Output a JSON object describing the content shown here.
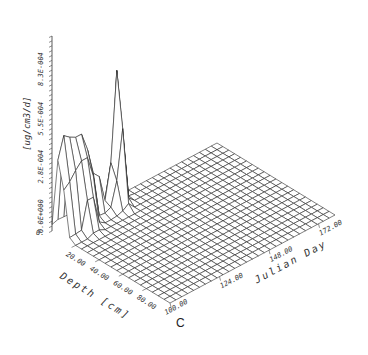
{
  "chart_data": {
    "type": "surface3d",
    "title": "",
    "caption": "C",
    "x_axis": {
      "label": "Depth [cm]",
      "range": [
        0,
        100
      ],
      "tick_labels": [
        "0.",
        "20.00",
        "40.00",
        "60.00",
        "80.00"
      ],
      "tick_values": [
        0,
        20,
        40,
        60,
        80
      ]
    },
    "y_axis": {
      "label": "Julian Day",
      "range": [
        100,
        180
      ],
      "tick_labels": [
        "100.00",
        "124.00",
        "148.00",
        "172.00"
      ],
      "tick_values": [
        100,
        124,
        148,
        172
      ]
    },
    "z_axis": {
      "label": "[ug/cm3/d]",
      "range": [
        0,
        0.0011
      ],
      "tick_labels": [
        "0.0E+000",
        "2.8E-004",
        "5.5E-004",
        "8.3E-004"
      ],
      "tick_values": [
        0,
        0.00028,
        0.00055,
        0.00083
      ]
    },
    "grid_size": {
      "depth_steps": 20,
      "day_steps": 28
    },
    "peaks": [
      {
        "depth": 5,
        "day": 101,
        "value": 0.00062
      },
      {
        "depth": 10,
        "day": 101,
        "value": 0.0004
      },
      {
        "depth": 5,
        "day": 104,
        "value": 0.0009
      },
      {
        "depth": 10,
        "day": 104,
        "value": 0.0005
      },
      {
        "depth": 5,
        "day": 107,
        "value": 0.00098
      },
      {
        "depth": 10,
        "day": 107,
        "value": 0.00066
      },
      {
        "depth": 5,
        "day": 110,
        "value": 0.0011
      },
      {
        "depth": 10,
        "day": 110,
        "value": 0.00085
      },
      {
        "depth": 15,
        "day": 110,
        "value": 0.0004
      },
      {
        "depth": 5,
        "day": 113,
        "value": 0.00075
      },
      {
        "depth": 10,
        "day": 113,
        "value": 0.0005
      },
      {
        "depth": 5,
        "day": 116,
        "value": 0.0004
      },
      {
        "depth": 5,
        "day": 119,
        "value": 0.0003
      },
      {
        "depth": 5,
        "day": 125,
        "value": 0.0003
      },
      {
        "depth": 5,
        "day": 128,
        "value": 0.00085
      },
      {
        "depth": 10,
        "day": 128,
        "value": 0.0005
      },
      {
        "depth": 5,
        "day": 131,
        "value": 0.0004
      },
      {
        "depth": 10,
        "day": 125,
        "value": 0.0002
      }
    ]
  }
}
